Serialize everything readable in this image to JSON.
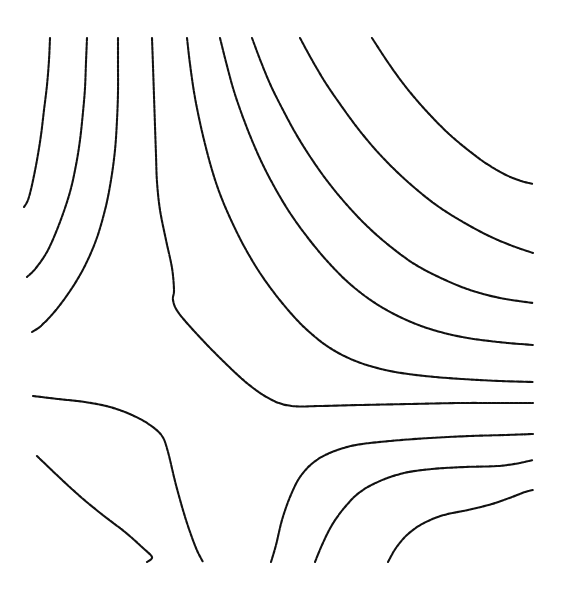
{
  "figure": {
    "title": "",
    "background_color": "#ffffff",
    "line_color": "#111111",
    "line_style": "dotted-dashed",
    "line_width": 2.1,
    "width": 564,
    "height": 590
  },
  "chart_data": {
    "type": "line",
    "title": "",
    "subtitle": "",
    "xlabel": "",
    "ylabel": "",
    "xlim": [
      0,
      564
    ],
    "ylim": [
      0,
      590
    ],
    "grid": false,
    "legend": null,
    "axes_visible": false,
    "tick_labels_x": [],
    "tick_labels_y": [],
    "annotations": [],
    "saddle_point": [
      172,
      372
    ],
    "series": [
      {
        "name": "contour-1",
        "points": [
          [
            50,
            38
          ],
          [
            49,
            60
          ],
          [
            47,
            85
          ],
          [
            44,
            110
          ],
          [
            41,
            135
          ],
          [
            37,
            160
          ],
          [
            32,
            185
          ],
          [
            28,
            200
          ],
          [
            24,
            207
          ]
        ]
      },
      {
        "name": "contour-2",
        "points": [
          [
            87,
            38
          ],
          [
            86,
            62
          ],
          [
            85,
            88
          ],
          [
            83,
            112
          ],
          [
            80,
            140
          ],
          [
            76,
            165
          ],
          [
            70,
            192
          ],
          [
            60,
            222
          ],
          [
            48,
            250
          ],
          [
            36,
            268
          ],
          [
            27,
            277
          ]
        ]
      },
      {
        "name": "contour-3",
        "points": [
          [
            118,
            38
          ],
          [
            118,
            64
          ],
          [
            118,
            92
          ],
          [
            117,
            120
          ],
          [
            115,
            150
          ],
          [
            111,
            180
          ],
          [
            105,
            210
          ],
          [
            95,
            243
          ],
          [
            80,
            275
          ],
          [
            60,
            305
          ],
          [
            42,
            325
          ],
          [
            32,
            332
          ]
        ]
      },
      {
        "name": "contour-4",
        "points": [
          [
            152,
            38
          ],
          [
            153,
            66
          ],
          [
            154,
            96
          ],
          [
            155,
            126
          ],
          [
            156,
            155
          ],
          [
            157,
            182
          ],
          [
            160,
            210
          ],
          [
            166,
            240
          ],
          [
            172,
            268
          ],
          [
            174,
            290
          ],
          [
            173,
            300
          ],
          [
            178,
            312
          ],
          [
            195,
            332
          ],
          [
            220,
            358
          ],
          [
            248,
            384
          ],
          [
            272,
            400
          ],
          [
            292,
            406
          ],
          [
            320,
            406
          ],
          [
            360,
            405
          ],
          [
            410,
            404
          ],
          [
            460,
            403
          ],
          [
            500,
            403
          ],
          [
            533,
            403
          ]
        ]
      },
      {
        "name": "contour-5",
        "points": [
          [
            187,
            38
          ],
          [
            190,
            64
          ],
          [
            194,
            92
          ],
          [
            199,
            118
          ],
          [
            205,
            144
          ],
          [
            212,
            170
          ],
          [
            220,
            194
          ],
          [
            231,
            220
          ],
          [
            245,
            248
          ],
          [
            262,
            276
          ],
          [
            283,
            304
          ],
          [
            305,
            328
          ],
          [
            330,
            348
          ],
          [
            358,
            362
          ],
          [
            390,
            371
          ],
          [
            425,
            376
          ],
          [
            462,
            379
          ],
          [
            500,
            381
          ],
          [
            533,
            382
          ]
        ]
      },
      {
        "name": "contour-6",
        "points": [
          [
            220,
            38
          ],
          [
            226,
            62
          ],
          [
            233,
            88
          ],
          [
            241,
            112
          ],
          [
            251,
            138
          ],
          [
            262,
            163
          ],
          [
            275,
            188
          ],
          [
            290,
            213
          ],
          [
            308,
            238
          ],
          [
            328,
            262
          ],
          [
            350,
            284
          ],
          [
            375,
            303
          ],
          [
            402,
            318
          ],
          [
            430,
            329
          ],
          [
            462,
            337
          ],
          [
            498,
            342
          ],
          [
            533,
            345
          ]
        ]
      },
      {
        "name": "contour-7",
        "points": [
          [
            252,
            38
          ],
          [
            261,
            62
          ],
          [
            271,
            86
          ],
          [
            283,
            110
          ],
          [
            296,
            134
          ],
          [
            311,
            158
          ],
          [
            328,
            182
          ],
          [
            347,
            205
          ],
          [
            368,
            227
          ],
          [
            391,
            247
          ],
          [
            416,
            265
          ],
          [
            443,
            279
          ],
          [
            470,
            290
          ],
          [
            500,
            298
          ],
          [
            533,
            303
          ]
        ]
      },
      {
        "name": "contour-8",
        "points": [
          [
            300,
            38
          ],
          [
            312,
            60
          ],
          [
            325,
            82
          ],
          [
            340,
            104
          ],
          [
            356,
            126
          ],
          [
            374,
            148
          ],
          [
            394,
            169
          ],
          [
            416,
            189
          ],
          [
            439,
            207
          ],
          [
            463,
            222
          ],
          [
            487,
            235
          ],
          [
            510,
            245
          ],
          [
            533,
            253
          ]
        ]
      },
      {
        "name": "contour-9",
        "points": [
          [
            372,
            38
          ],
          [
            385,
            58
          ],
          [
            399,
            78
          ],
          [
            414,
            97
          ],
          [
            431,
            116
          ],
          [
            449,
            134
          ],
          [
            468,
            150
          ],
          [
            487,
            164
          ],
          [
            506,
            175
          ],
          [
            521,
            181
          ],
          [
            533,
            184
          ]
        ]
      },
      {
        "name": "contour-10",
        "points": [
          [
            33,
            396
          ],
          [
            58,
            399
          ],
          [
            85,
            402
          ],
          [
            110,
            407
          ],
          [
            132,
            415
          ],
          [
            150,
            425
          ],
          [
            162,
            436
          ],
          [
            168,
            452
          ],
          [
            176,
            485
          ],
          [
            186,
            520
          ],
          [
            196,
            548
          ],
          [
            203,
            562
          ]
        ]
      },
      {
        "name": "contour-11",
        "points": [
          [
            37,
            456
          ],
          [
            60,
            478
          ],
          [
            82,
            498
          ],
          [
            104,
            516
          ],
          [
            125,
            532
          ],
          [
            143,
            548
          ],
          [
            152,
            557
          ],
          [
            147,
            562
          ]
        ]
      },
      {
        "name": "contour-12",
        "points": [
          [
            271,
            562
          ],
          [
            276,
            545
          ],
          [
            282,
            520
          ],
          [
            290,
            497
          ],
          [
            300,
            477
          ],
          [
            314,
            462
          ],
          [
            332,
            452
          ],
          [
            356,
            445
          ],
          [
            390,
            441
          ],
          [
            430,
            438
          ],
          [
            470,
            436
          ],
          [
            505,
            435
          ],
          [
            533,
            434
          ]
        ]
      },
      {
        "name": "contour-13",
        "points": [
          [
            315,
            562
          ],
          [
            322,
            545
          ],
          [
            332,
            525
          ],
          [
            345,
            507
          ],
          [
            360,
            492
          ],
          [
            380,
            481
          ],
          [
            404,
            473
          ],
          [
            432,
            469
          ],
          [
            465,
            467
          ],
          [
            498,
            466
          ],
          [
            520,
            463
          ],
          [
            533,
            460
          ]
        ]
      },
      {
        "name": "contour-14",
        "points": [
          [
            388,
            562
          ],
          [
            396,
            548
          ],
          [
            408,
            534
          ],
          [
            424,
            523
          ],
          [
            444,
            515
          ],
          [
            468,
            510
          ],
          [
            492,
            504
          ],
          [
            512,
            497
          ],
          [
            525,
            492
          ],
          [
            533,
            490
          ]
        ]
      }
    ]
  }
}
